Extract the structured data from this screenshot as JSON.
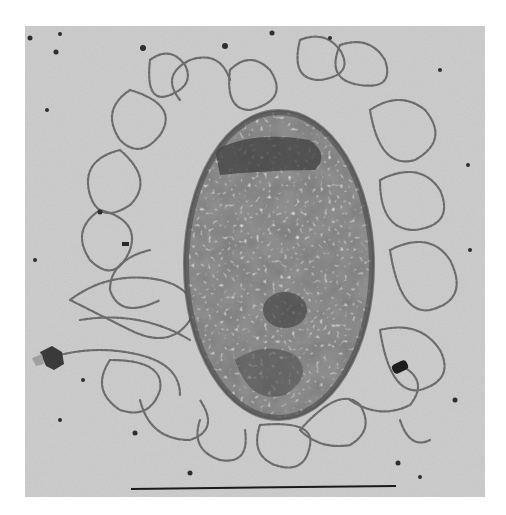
{
  "image": {
    "description": "Transmission electron micrograph of a lysed cell/nucleoid with DNA loops spreading outward on a stippled background, with a scale bar at the bottom",
    "scale_bar": {
      "x1": 131,
      "x2": 396,
      "y": 488,
      "color": "#1a1a1a"
    },
    "frame": {
      "x": 25,
      "y": 26,
      "width": 460,
      "height": 471,
      "background": "#c9c9c9"
    },
    "body": {
      "cx": 279,
      "cy": 265,
      "rx": 93,
      "ry": 153,
      "color": "#5e5e5e"
    },
    "colors": {
      "page": "#ffffff",
      "background": "#c8c8c8",
      "stipple": "#9a9a9a",
      "fiber": "#6f6f6f",
      "body_dark": "#3f3f3f",
      "body_light": "#bdbdbd",
      "particle": "#2a2a2a"
    }
  }
}
